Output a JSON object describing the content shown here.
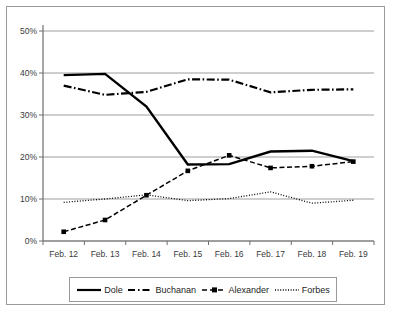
{
  "chart_data": {
    "type": "line",
    "title": "",
    "xlabel": "",
    "ylabel": "",
    "categories": [
      "Feb. 12",
      "Feb. 13",
      "Feb. 14",
      "Feb. 15",
      "Feb. 16",
      "Feb. 17",
      "Feb. 18",
      "Feb. 19"
    ],
    "ylim": [
      0,
      50
    ],
    "ytick_labels": [
      "0%",
      "10%",
      "20%",
      "30%",
      "40%",
      "50%"
    ],
    "ytick_values": [
      0,
      10,
      20,
      30,
      40,
      50
    ],
    "grid": true,
    "grid_axis": "y",
    "legend_position": "bottom",
    "series": [
      {
        "name": "Dole",
        "style": "solid",
        "color": "#000000",
        "markers": false,
        "values": [
          39.5,
          39.8,
          32.0,
          18.2,
          18.3,
          21.3,
          21.5,
          19.0
        ]
      },
      {
        "name": "Buchanan",
        "style": "dash-dot",
        "color": "#000000",
        "markers": false,
        "values": [
          37.0,
          34.8,
          35.5,
          38.5,
          38.4,
          35.4,
          36.0,
          36.1
        ]
      },
      {
        "name": "Alexander",
        "style": "dashed",
        "color": "#000000",
        "markers": true,
        "values": [
          2.2,
          5.0,
          10.9,
          16.7,
          20.4,
          17.4,
          17.8,
          18.9
        ]
      },
      {
        "name": "Forbes",
        "style": "dotted",
        "color": "#000000",
        "markers": false,
        "values": [
          9.2,
          10.0,
          11.0,
          9.6,
          10.1,
          11.7,
          9.0,
          9.7
        ]
      }
    ]
  },
  "legend": {
    "items": [
      {
        "label": "Dole"
      },
      {
        "label": "Buchanan"
      },
      {
        "label": "Alexander"
      },
      {
        "label": "Forbes"
      }
    ]
  },
  "axes": {
    "y_labels": [
      "50%",
      "40%",
      "30%",
      "20%",
      "10%",
      "0%"
    ],
    "x_labels": [
      "Feb. 12",
      "Feb. 13",
      "Feb. 14",
      "Feb. 15",
      "Feb. 16",
      "Feb. 17",
      "Feb. 18",
      "Feb. 19"
    ]
  }
}
